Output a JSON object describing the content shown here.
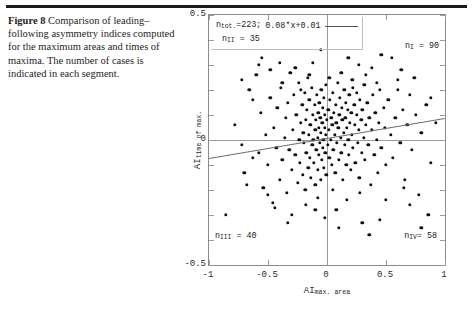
{
  "figure": {
    "label": "Figure 8",
    "caption_text": "Comparison of leading–following asymmetry indices computed for the maximum areas and times of maxima. The number of cases is indicated in each segment."
  },
  "chart_data": {
    "type": "scatter",
    "title": "",
    "xlabel": "AI max. area",
    "ylabel": "AI time of max.",
    "xlabel_main": "AI",
    "xlabel_sub": "max. area",
    "ylabel_main": "AI",
    "ylabel_sub": "time of max.",
    "xlim": [
      -1,
      1
    ],
    "ylim": [
      -0.5,
      0.5
    ],
    "xticks": [
      "-1",
      "-0.5",
      "0",
      "0.5",
      "1"
    ],
    "xtick_values": [
      -1,
      -0.5,
      0,
      0.5,
      1
    ],
    "yticks": [
      "0.5",
      "0",
      "-0.5"
    ],
    "ytick_values": [
      0.5,
      0,
      -0.5
    ],
    "grid": false,
    "origin_axes": true,
    "legend_position": "top-left",
    "legend": {
      "n_total_label": "n",
      "n_total_sub": "tot.",
      "n_total_text": "=223;",
      "n_total_value": 223,
      "fit_equation": "0.08*x+0.01",
      "line_sample": true
    },
    "fit": {
      "slope": 0.08,
      "intercept": 0.01
    },
    "quadrant_counts": [
      {
        "name": "n_I",
        "base": "n",
        "sub": "I",
        "text": "= 90",
        "value": 90,
        "quadrant": "upper-right"
      },
      {
        "name": "n_II",
        "base": "n",
        "sub": "II",
        "text": "= 35",
        "value": 35,
        "quadrant": "upper-left"
      },
      {
        "name": "n_III",
        "base": "n",
        "sub": "III",
        "text": "= 40",
        "value": 40,
        "quadrant": "lower-left"
      },
      {
        "name": "n_IV",
        "base": "n",
        "sub": "IV",
        "text": "= 58",
        "value": 58,
        "quadrant": "lower-right"
      }
    ],
    "points": [
      [
        -0.78,
        0.06
      ],
      [
        -0.72,
        -0.02
      ],
      [
        -0.7,
        -0.13
      ],
      [
        -0.66,
        0.2
      ],
      [
        -0.63,
        -0.07
      ],
      [
        -0.6,
        0.26
      ],
      [
        -0.58,
        -0.05
      ],
      [
        -0.56,
        0.11
      ],
      [
        -0.54,
        -0.19
      ],
      [
        -0.52,
        0.02
      ],
      [
        -0.5,
        -0.1
      ],
      [
        -0.48,
        0.17
      ],
      [
        -0.46,
        -0.25
      ],
      [
        -0.45,
        0.05
      ],
      [
        -0.43,
        -0.03
      ],
      [
        -0.42,
        0.13
      ],
      [
        -0.4,
        -0.16
      ],
      [
        -0.39,
        0.21
      ],
      [
        -0.38,
        -0.08
      ],
      [
        -0.36,
        0.01
      ],
      [
        -0.35,
        0.09
      ],
      [
        -0.34,
        -0.21
      ],
      [
        -0.33,
        0.15
      ],
      [
        -0.32,
        -0.04
      ],
      [
        -0.31,
        0.27
      ],
      [
        -0.3,
        -0.12
      ],
      [
        -0.29,
        0.04
      ],
      [
        -0.28,
        0.18
      ],
      [
        -0.27,
        -0.06
      ],
      [
        -0.26,
        0.1
      ],
      [
        -0.25,
        -0.17
      ],
      [
        -0.24,
        0.23
      ],
      [
        -0.235,
        0.0
      ],
      [
        -0.23,
        -0.09
      ],
      [
        -0.22,
        0.07
      ],
      [
        -0.21,
        0.14
      ],
      [
        -0.205,
        -0.14
      ],
      [
        -0.2,
        0.03
      ],
      [
        -0.195,
        -0.01
      ],
      [
        -0.19,
        0.19
      ],
      [
        -0.185,
        -0.2
      ],
      [
        -0.18,
        0.08
      ],
      [
        -0.175,
        -0.05
      ],
      [
        -0.17,
        0.12
      ],
      [
        -0.165,
        0.25
      ],
      [
        -0.16,
        -0.11
      ],
      [
        -0.155,
        0.02
      ],
      [
        -0.15,
        0.16
      ],
      [
        -0.145,
        -0.07
      ],
      [
        -0.14,
        0.06
      ],
      [
        -0.135,
        -0.15
      ],
      [
        -0.13,
        0.21
      ],
      [
        -0.125,
        -0.02
      ],
      [
        -0.12,
        0.1
      ],
      [
        -0.115,
        0.0
      ],
      [
        -0.11,
        -0.09
      ],
      [
        -0.105,
        0.14
      ],
      [
        -0.1,
        0.04
      ],
      [
        -0.098,
        -0.18
      ],
      [
        -0.095,
        0.08
      ],
      [
        -0.09,
        -0.04
      ],
      [
        -0.085,
        0.18
      ],
      [
        -0.08,
        0.01
      ],
      [
        -0.078,
        -0.12
      ],
      [
        -0.075,
        0.11
      ],
      [
        -0.07,
        0.05
      ],
      [
        -0.068,
        -0.06
      ],
      [
        -0.065,
        0.15
      ],
      [
        -0.06,
        -0.01
      ],
      [
        -0.058,
        0.09
      ],
      [
        -0.055,
        -0.16
      ],
      [
        -0.05,
        0.03
      ],
      [
        -0.048,
        0.2
      ],
      [
        -0.045,
        -0.08
      ],
      [
        -0.04,
        0.07
      ],
      [
        -0.038,
        0.13
      ],
      [
        -0.035,
        -0.03
      ],
      [
        -0.03,
        0.0
      ],
      [
        -0.028,
        0.17
      ],
      [
        -0.025,
        -0.11
      ],
      [
        -0.02,
        0.05
      ],
      [
        -0.018,
        0.1
      ],
      [
        -0.015,
        -0.05
      ],
      [
        -0.01,
        0.02
      ],
      [
        -0.008,
        0.22
      ],
      [
        -0.005,
        -0.14
      ],
      [
        0.0,
        0.08
      ],
      [
        0.005,
        -0.02
      ],
      [
        0.01,
        0.12
      ],
      [
        0.015,
        0.04
      ],
      [
        0.02,
        -0.07
      ],
      [
        0.025,
        0.16
      ],
      [
        0.03,
        0.0
      ],
      [
        0.035,
        0.09
      ],
      [
        0.04,
        -0.1
      ],
      [
        0.045,
        0.06
      ],
      [
        0.05,
        0.19
      ],
      [
        0.055,
        -0.04
      ],
      [
        0.06,
        0.11
      ],
      [
        0.065,
        0.02
      ],
      [
        0.07,
        -0.13
      ],
      [
        0.075,
        0.14
      ],
      [
        0.08,
        0.07
      ],
      [
        0.085,
        -0.01
      ],
      [
        0.09,
        0.23
      ],
      [
        0.095,
        0.05
      ],
      [
        0.1,
        -0.08
      ],
      [
        0.105,
        0.1
      ],
      [
        0.11,
        0.17
      ],
      [
        0.115,
        0.01
      ],
      [
        0.12,
        -0.05
      ],
      [
        0.125,
        0.13
      ],
      [
        0.13,
        0.08
      ],
      [
        0.135,
        -0.16
      ],
      [
        0.14,
        0.03
      ],
      [
        0.145,
        0.2
      ],
      [
        0.15,
        -0.02
      ],
      [
        0.155,
        0.09
      ],
      [
        0.16,
        0.15
      ],
      [
        0.165,
        -0.1
      ],
      [
        0.17,
        0.05
      ],
      [
        0.175,
        0.12
      ],
      [
        0.18,
        0.0
      ],
      [
        0.185,
        -0.06
      ],
      [
        0.19,
        0.18
      ],
      [
        0.195,
        0.07
      ],
      [
        0.2,
        -0.12
      ],
      [
        0.205,
        0.11
      ],
      [
        0.21,
        0.02
      ],
      [
        0.215,
        0.24
      ],
      [
        0.22,
        -0.03
      ],
      [
        0.23,
        0.14
      ],
      [
        0.235,
        0.06
      ],
      [
        0.24,
        -0.09
      ],
      [
        0.25,
        0.1
      ],
      [
        0.255,
        0.19
      ],
      [
        0.26,
        -0.01
      ],
      [
        0.27,
        0.04
      ],
      [
        0.275,
        -0.15
      ],
      [
        0.28,
        0.16
      ],
      [
        0.29,
        0.08
      ],
      [
        0.295,
        -0.05
      ],
      [
        0.3,
        0.12
      ],
      [
        0.31,
        0.01
      ],
      [
        0.315,
        0.22
      ],
      [
        0.32,
        -0.08
      ],
      [
        0.33,
        0.06
      ],
      [
        0.34,
        0.15
      ],
      [
        0.35,
        -0.02
      ],
      [
        0.36,
        0.09
      ],
      [
        0.37,
        -0.18
      ],
      [
        0.38,
        0.04
      ],
      [
        0.39,
        0.18
      ],
      [
        0.4,
        -0.06
      ],
      [
        0.41,
        0.11
      ],
      [
        0.42,
        0.0
      ],
      [
        0.43,
        -0.13
      ],
      [
        0.44,
        0.07
      ],
      [
        0.45,
        0.2
      ],
      [
        0.46,
        -0.03
      ],
      [
        0.48,
        0.13
      ],
      [
        0.49,
        0.05
      ],
      [
        0.5,
        -0.1
      ],
      [
        0.52,
        0.16
      ],
      [
        0.54,
        0.02
      ],
      [
        0.56,
        -0.07
      ],
      [
        0.58,
        0.09
      ],
      [
        0.6,
        0.24
      ],
      [
        0.62,
        -0.01
      ],
      [
        0.64,
        0.12
      ],
      [
        0.66,
        -0.16
      ],
      [
        0.68,
        0.06
      ],
      [
        0.7,
        0.18
      ],
      [
        0.72,
        -0.04
      ],
      [
        0.75,
        0.1
      ],
      [
        0.78,
        -0.22
      ],
      [
        0.8,
        0.03
      ],
      [
        0.84,
        0.14
      ],
      [
        0.88,
        -0.09
      ],
      [
        0.92,
        0.07
      ],
      [
        -0.86,
        -0.3
      ],
      [
        -0.55,
        0.33
      ],
      [
        -0.33,
        -0.33
      ],
      [
        -0.12,
        0.31
      ],
      [
        0.08,
        -0.28
      ],
      [
        0.27,
        0.3
      ],
      [
        0.45,
        -0.32
      ],
      [
        0.63,
        0.28
      ],
      [
        0.8,
        -0.35
      ],
      [
        0.36,
        -0.38
      ],
      [
        -0.05,
        0.36
      ],
      [
        0.17,
        -0.24
      ],
      [
        -0.27,
        0.29
      ],
      [
        0.55,
        0.33
      ],
      [
        -0.44,
        -0.27
      ],
      [
        0.12,
        0.27
      ],
      [
        -0.18,
        -0.26
      ],
      [
        0.33,
        0.26
      ],
      [
        -0.63,
        0.16
      ],
      [
        0.7,
        -0.26
      ],
      [
        -0.08,
        -0.23
      ],
      [
        0.22,
        0.21
      ],
      [
        -0.38,
        0.23
      ],
      [
        0.05,
        -0.2
      ],
      [
        0.42,
        0.23
      ],
      [
        -0.5,
        -0.22
      ],
      [
        0.6,
        0.2
      ],
      [
        -0.72,
        0.24
      ],
      [
        0.88,
        0.17
      ],
      [
        -0.15,
        0.26
      ],
      [
        0.28,
        -0.21
      ],
      [
        -0.3,
        -0.3
      ],
      [
        0.5,
        -0.24
      ],
      [
        0.02,
        0.25
      ],
      [
        -0.22,
        0.2
      ],
      [
        0.65,
        -0.19
      ],
      [
        -0.58,
        0.3
      ],
      [
        0.38,
        0.29
      ],
      [
        -0.02,
        -0.31
      ],
      [
        0.18,
        0.33
      ],
      [
        -0.48,
        0.28
      ],
      [
        0.74,
        0.25
      ],
      [
        -0.1,
        -0.28
      ],
      [
        0.3,
        -0.33
      ],
      [
        -0.4,
        0.31
      ],
      [
        0.1,
        -0.35
      ],
      [
        -0.68,
        -0.18
      ],
      [
        0.46,
        0.34
      ],
      [
        0.86,
        -0.3
      ]
    ]
  }
}
